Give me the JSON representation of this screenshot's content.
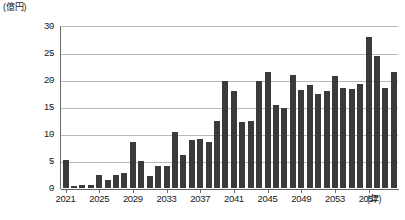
{
  "chart_data": {
    "type": "bar",
    "title": "",
    "subtitle": "",
    "xlabel": "(年)",
    "ylabel": "(億円)",
    "ylim": [
      0,
      30
    ],
    "ytick_step": 5,
    "ytick_labels": [
      "0",
      "5",
      "10",
      "15",
      "20",
      "25",
      "30"
    ],
    "grid": "horizontal",
    "legend": "none",
    "bar_color": "#3a3a3a",
    "x_axis_tick_labels": [
      "2021",
      "2025",
      "2029",
      "2033",
      "2037",
      "2041",
      "2045",
      "2049",
      "2053",
      "2057"
    ],
    "categories": [
      "2021",
      "2022",
      "2023",
      "2024",
      "2025",
      "2026",
      "2027",
      "2028",
      "2029",
      "2030",
      "2031",
      "2032",
      "2033",
      "2034",
      "2035",
      "2036",
      "2037",
      "2038",
      "2039",
      "2040",
      "2041",
      "2042",
      "2043",
      "2044",
      "2045",
      "2046",
      "2047",
      "2048",
      "2049",
      "2050",
      "2051",
      "2052",
      "2053",
      "2054",
      "2055",
      "2056",
      "2057",
      "2058",
      "2059",
      "2060"
    ],
    "values": [
      5.1,
      0.3,
      0.6,
      0.5,
      2.5,
      1.5,
      2.4,
      2.7,
      8.6,
      5.0,
      2.2,
      4.0,
      4.0,
      10.4,
      6.1,
      8.8,
      9.0,
      8.5,
      12.5,
      19.9,
      18.0,
      12.3,
      12.4,
      19.9,
      21.5,
      15.4,
      14.9,
      21.0,
      18.1,
      19.0,
      17.4,
      17.9,
      20.7,
      18.5,
      18.4,
      19.2,
      28.0,
      24.5,
      18.5,
      21.5
    ]
  }
}
